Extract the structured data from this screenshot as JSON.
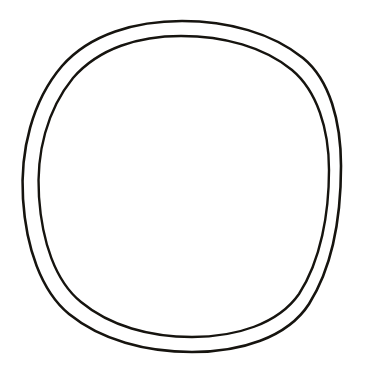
{
  "page": {
    "width": 366,
    "height": 373,
    "background_color": "#ffffff",
    "description": "A simple black-and-white line drawing consisting of two concentric, slightly irregular hand-drawn circles (a ring / annulus outline) centered on a plain white background. The interior of the inner circle is empty white."
  },
  "artwork": {
    "name": "concentric-circles",
    "stroke_color": "#16140f",
    "fill_color": "none",
    "stroke_width_px": 2.5,
    "shape_count": 2,
    "style": "hand-drawn outline, no shading, no text",
    "shapes": [
      {
        "name": "outer-circle",
        "label": "Outer circle",
        "center_x": 182,
        "center_y": 186.5,
        "radius_x": 159,
        "radius_y": 165.5,
        "bounds": {
          "left": 23,
          "top": 21,
          "right": 341,
          "bottom": 352
        },
        "stroke_width_px": 2.6
      },
      {
        "name": "inner-circle",
        "label": "Inner circle",
        "center_x": 181,
        "center_y": 186.5,
        "radius_x": 148,
        "radius_y": 150.5,
        "bounds": {
          "left": 33,
          "top": 36,
          "right": 329,
          "bottom": 337
        },
        "stroke_width_px": 2.4
      }
    ],
    "ring_gap_px": {
      "top": 13,
      "left": 9,
      "right": 11,
      "bottom": 15
    }
  }
}
